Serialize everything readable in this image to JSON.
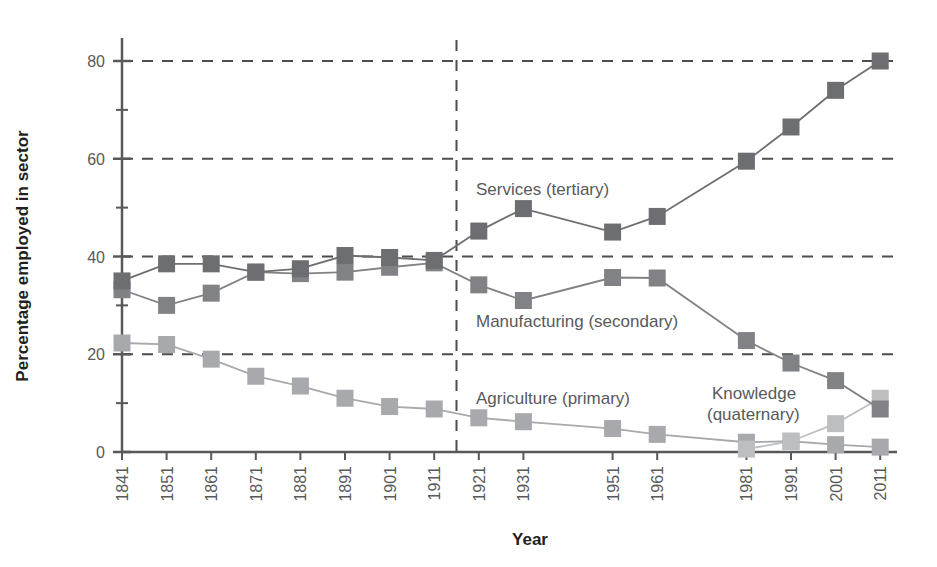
{
  "chart_data": {
    "type": "line",
    "title": "",
    "xlabel": "Year",
    "ylabel": "Percentage employed in sector",
    "ylim": [
      0,
      86
    ],
    "yticks": [
      0,
      20,
      40,
      60,
      80
    ],
    "grid": "horizontal-dashed",
    "legend": "inline-annotations",
    "categories": [
      "1841",
      "1851",
      "1861",
      "1871",
      "1881",
      "1891",
      "1901",
      "1911",
      "1921",
      "1931",
      "1951",
      "1961",
      "1981",
      "1991",
      "2001",
      "2011"
    ],
    "annotations": [
      {
        "text": "Services (tertiary)",
        "x": 1921,
        "y": 52
      },
      {
        "text": "Manufacturing (secondary)",
        "x": 1921,
        "y": 26
      },
      {
        "text": "Agriculture (primary)",
        "x": 1921,
        "y": 10
      },
      {
        "text": "Knowledge",
        "x": 1986,
        "y": 11
      },
      {
        "text": "(quaternary)",
        "x": 1986,
        "y": 7
      }
    ],
    "vertical_divider": {
      "position": "between 1911 and 1921",
      "style": "dashed"
    },
    "series": [
      {
        "name": "Services (tertiary)",
        "color": "#6d6e71",
        "values": [
          35.0,
          38.5,
          38.5,
          36.8,
          37.5,
          40.2,
          39.8,
          39.2,
          45.2,
          49.8,
          45.0,
          48.2,
          59.5,
          66.5,
          74.0,
          80.0
        ]
      },
      {
        "name": "Manufacturing (secondary)",
        "color": "#808285",
        "values": [
          33.2,
          30.0,
          32.5,
          36.8,
          36.5,
          36.8,
          37.8,
          38.7,
          34.2,
          31.0,
          35.7,
          35.6,
          22.8,
          18.2,
          14.6,
          8.8
        ]
      },
      {
        "name": "Agriculture (primary)",
        "color": "#a7a9ac",
        "values": [
          22.3,
          22.0,
          19.0,
          15.5,
          13.5,
          11.0,
          9.3,
          8.8,
          7.0,
          6.2,
          4.8,
          3.6,
          2.0,
          2.2,
          1.5,
          1.0
        ]
      },
      {
        "name": "Knowledge (quaternary)",
        "color": "#bcbec0",
        "values": [
          null,
          null,
          null,
          null,
          null,
          null,
          null,
          null,
          null,
          null,
          null,
          null,
          0.6,
          2.2,
          5.8,
          11.0
        ]
      }
    ]
  },
  "axis": {
    "y_title": "Percentage employed in sector",
    "x_title": "Year",
    "y_tick_labels": [
      "80",
      "60",
      "40",
      "20",
      "0"
    ],
    "x_tick_labels": [
      "1841",
      "1851",
      "1861",
      "1871",
      "1881",
      "1891",
      "1901",
      "1911",
      "1921",
      "1931",
      "1951",
      "1961",
      "1981",
      "1991",
      "2001",
      "2011"
    ]
  },
  "labels": {
    "services": "Services (tertiary)",
    "manufacturing": "Manufacturing (secondary)",
    "agriculture": "Agriculture (primary)",
    "knowledge_line1": "Knowledge",
    "knowledge_line2": "(quaternary)"
  },
  "colors": {
    "services": "#6d6e71",
    "manufacturing": "#808285",
    "agriculture": "#a7a9ac",
    "knowledge": "#bcbec0",
    "axis": "#58595b",
    "grid": "#4d4d4d",
    "text": "#231f20"
  }
}
